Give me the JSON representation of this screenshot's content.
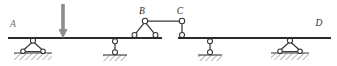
{
  "figure": {
    "type": "structural-beam-diagram",
    "canvas": {
      "width": 337,
      "height": 66
    },
    "colors": {
      "beam": "#2b2b2b",
      "member": "#3a3a3a",
      "pin_fill": "#ffffff",
      "pin_stroke": "#333333",
      "load_arrow": "#8d8d8d",
      "ground": "#4a4a4a",
      "label": "#2d2d2d",
      "background": "#ffffff"
    }
  },
  "labels": {
    "a": "A",
    "b": "B",
    "c": "C",
    "d": "D"
  },
  "label_positions": {
    "a": {
      "x": 13,
      "y": 26
    },
    "b": {
      "x": 141,
      "y": 14
    },
    "c": {
      "x": 178,
      "y": 13
    },
    "d": {
      "x": 318,
      "y": 25
    }
  },
  "beam": {
    "y": 38,
    "segments": [
      {
        "name": "left-span-A-to-hinge",
        "x1": 8,
        "x2": 162
      },
      {
        "name": "right-span-hinge-to-D",
        "x1": 178,
        "x2": 331
      }
    ],
    "gap": {
      "x1": 162,
      "x2": 178
    }
  },
  "load": {
    "name": "point-load-arrow",
    "x": 63,
    "top_y": 4,
    "tip_y": 38,
    "shaft_width": 3.6,
    "head_width": 9,
    "head_height": 9
  },
  "supports": [
    {
      "id": "support-a",
      "kind": "pinned-frame",
      "x": 33,
      "beam_y": 38,
      "apex_y": 41,
      "base_y": 52,
      "half_width": 11,
      "ground_y": 53,
      "ground_half_width": 19,
      "hatch_depth": 7
    },
    {
      "id": "support-2",
      "kind": "link-roller",
      "x": 115,
      "beam_y": 38,
      "top_pin_y": 41,
      "bottom_pin_y": 52,
      "ground_y": 55,
      "ground_half_width": 12,
      "hatch_depth": 6
    },
    {
      "id": "support-3",
      "kind": "link-roller",
      "x": 210,
      "beam_y": 38,
      "top_pin_y": 41,
      "bottom_pin_y": 52,
      "ground_y": 55,
      "ground_half_width": 12,
      "hatch_depth": 6
    },
    {
      "id": "support-d",
      "kind": "pinned-frame",
      "x": 290,
      "beam_y": 38,
      "apex_y": 41,
      "base_y": 52,
      "half_width": 11,
      "ground_y": 53,
      "ground_half_width": 19,
      "hatch_depth": 7
    }
  ],
  "linkage": {
    "b_node": {
      "x": 145,
      "y": 21
    },
    "b_left_foot": {
      "x": 134,
      "y": 35
    },
    "b_right_foot": {
      "x": 156,
      "y": 35
    },
    "c_node": {
      "x": 182,
      "y": 21
    },
    "c_foot": {
      "x": 182,
      "y": 35
    },
    "top_chord": {
      "x1": 145,
      "x2": 182,
      "y": 21
    }
  },
  "pin_radius": 2.6,
  "small_pin_radius": 2.3
}
